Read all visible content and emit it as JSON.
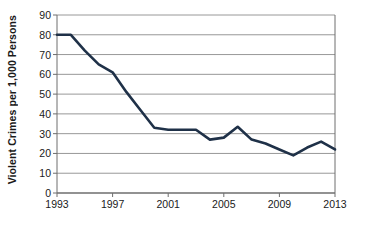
{
  "chart_data": {
    "type": "line",
    "title": "",
    "xlabel": "",
    "ylabel": "Violent Crimes per 1,000 Persons",
    "xlim": [
      1993,
      2013
    ],
    "ylim": [
      0,
      90
    ],
    "grid": true,
    "legend": "none",
    "y_ticks": [
      0,
      10,
      20,
      30,
      40,
      50,
      60,
      70,
      80,
      90
    ],
    "y_tick_labels": [
      "0",
      "10",
      "20",
      "30",
      "40",
      "50",
      "60",
      "70",
      "80",
      "90"
    ],
    "x_ticks": [
      1993,
      1997,
      2001,
      2005,
      2009,
      2013
    ],
    "x_tick_labels": [
      "1993",
      "1997",
      "2001",
      "2005",
      "2009",
      "2013"
    ],
    "x": [
      1993,
      1994,
      1995,
      1996,
      1997,
      1998,
      1999,
      2000,
      2001,
      2002,
      2003,
      2004,
      2005,
      2006,
      2007,
      2008,
      2009,
      2010,
      2011,
      2012,
      2013
    ],
    "values": [
      80,
      80,
      72,
      65,
      61,
      51,
      42,
      33,
      32,
      32,
      32,
      27,
      28,
      33.5,
      27,
      25,
      22,
      19,
      23,
      26,
      22
    ],
    "series": [
      {
        "name": "Violent Crimes per 1,000 Persons",
        "values": [
          80,
          80,
          72,
          65,
          61,
          51,
          42,
          33,
          32,
          32,
          32,
          27,
          28,
          33.5,
          27,
          25,
          22,
          19,
          23,
          26,
          22
        ]
      }
    ],
    "colors": {
      "line": "#1f3148",
      "grid": "#8c8c8c",
      "axis": "#6e6e6e",
      "text": "#1a1a1a",
      "background": "#ffffff"
    }
  }
}
